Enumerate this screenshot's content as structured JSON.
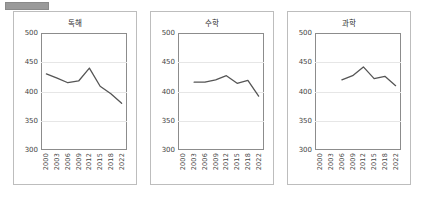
{
  "page": {
    "background": "#ffffff",
    "accent": "#555555",
    "grid_color": "#e6e6e6",
    "frame_color": "#8c8c8c",
    "panel_border": "#bdbdbd"
  },
  "top_marker": {
    "name": "gray-bar-marker",
    "color": "#9a9a9a"
  },
  "axis": {
    "y_ticks": [
      "300",
      "350",
      "400",
      "450",
      "500"
    ],
    "x_ticks": [
      "2000",
      "2003",
      "2006",
      "2009",
      "2012",
      "2015",
      "2018",
      "2022"
    ],
    "ylim": [
      300,
      500
    ]
  },
  "chart_data": [
    {
      "type": "line",
      "title": "독해",
      "xlabel": "",
      "ylabel": "",
      "ylim": [
        300,
        500
      ],
      "grid": true,
      "legend": "none",
      "categories": [
        "2000",
        "2003",
        "2006",
        "2009",
        "2012",
        "2015",
        "2018",
        "2022"
      ],
      "values": [
        430,
        423,
        415,
        418,
        440,
        409,
        396,
        380
      ]
    },
    {
      "type": "line",
      "title": "수학",
      "xlabel": "",
      "ylabel": "",
      "ylim": [
        300,
        500
      ],
      "grid": true,
      "legend": "none",
      "categories": [
        "2000",
        "2003",
        "2006",
        "2009",
        "2012",
        "2015",
        "2018",
        "2022"
      ],
      "values": [
        null,
        416,
        416,
        420,
        427,
        414,
        419,
        392
      ]
    },
    {
      "type": "line",
      "title": "과학",
      "xlabel": "",
      "ylabel": "",
      "ylim": [
        300,
        500
      ],
      "grid": true,
      "legend": "none",
      "categories": [
        "2000",
        "2003",
        "2006",
        "2009",
        "2012",
        "2015",
        "2018",
        "2022"
      ],
      "values": [
        null,
        null,
        420,
        427,
        442,
        422,
        426,
        410
      ]
    }
  ]
}
